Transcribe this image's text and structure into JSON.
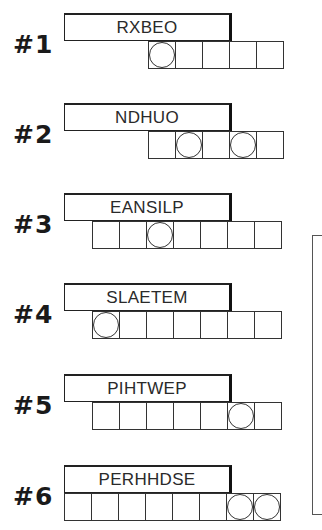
{
  "puzzles": [
    {
      "number": "#1",
      "scrambled": "RXBEO",
      "length": 5,
      "circled": [
        0
      ],
      "top": 13,
      "row_left": 148
    },
    {
      "number": "#2",
      "scrambled": "NDHUO",
      "length": 5,
      "circled": [
        1,
        3
      ],
      "top": 103,
      "row_left": 148
    },
    {
      "number": "#3",
      "scrambled": "EANSILP",
      "length": 7,
      "circled": [
        2
      ],
      "top": 193,
      "row_left": 92
    },
    {
      "number": "#4",
      "scrambled": "SLAETEM",
      "length": 7,
      "circled": [
        0
      ],
      "top": 283,
      "row_left": 92
    },
    {
      "number": "#5",
      "scrambled": "PIHTWEP",
      "length": 7,
      "circled": [
        5
      ],
      "top": 374,
      "row_left": 92
    },
    {
      "number": "#6",
      "scrambled": "PERHHDSE",
      "length": 8,
      "circled": [
        6,
        7
      ],
      "top": 465,
      "row_left": 64
    }
  ]
}
